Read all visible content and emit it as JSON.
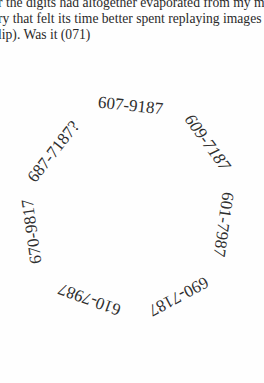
{
  "paragraph": {
    "lines": [
      "r the digits had altogether evaporated from my me",
      "ry that felt its time better spent replaying images of",
      "lip). Was it (071)"
    ]
  },
  "number_ring": {
    "items": [
      {
        "text": "607-9187"
      },
      {
        "text": "609-7187"
      },
      {
        "text": "601-7987"
      },
      {
        "text": "690-7187"
      },
      {
        "text": "610-7987"
      },
      {
        "text": "670-9817"
      },
      {
        "text": "687-7187?"
      }
    ]
  }
}
